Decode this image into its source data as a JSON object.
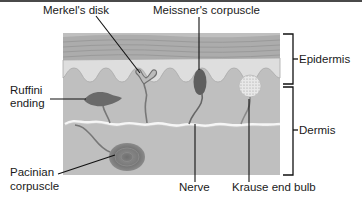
{
  "diagram": {
    "layers": [
      {
        "name": "Epidermis",
        "label": "Epidermis"
      },
      {
        "name": "Dermis",
        "label": "Dermis"
      }
    ],
    "labels": {
      "merkels_disk": "Merkel's disk",
      "meissners_corpuscle": "Meissner's corpuscle",
      "ruffini_line1": "Ruffini",
      "ruffini_line2": "ending",
      "pacinian_line1": "Pacinian",
      "pacinian_line2": "corpuscle",
      "nerve": "Nerve",
      "krause": "Krause end bulb",
      "epidermis": "Epidermis",
      "dermis": "Dermis"
    },
    "colors": {
      "stratum_bands": "#a9a9a9",
      "epidermis_light": "#dcdcdc",
      "dermis": "#bdbdbd",
      "receptor_dark": "#6a6a6a",
      "leader_line": "#111111",
      "nerve_line": "#f4f4f4"
    }
  }
}
